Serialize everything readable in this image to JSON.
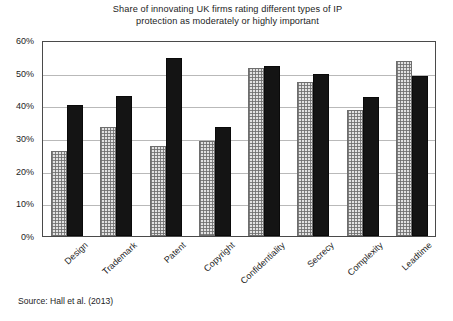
{
  "chart_data": {
    "type": "bar",
    "title": "Share of innovating UK firms rating different types of IP protection as moderately or highly important",
    "title_lines": [
      "Share of innovating UK firms rating different types of IP",
      "protection as moderately or highly important"
    ],
    "xlabel": "",
    "ylabel": "",
    "ylim": [
      0,
      60
    ],
    "ytick_labels": [
      "0%",
      "10%",
      "20%",
      "30%",
      "40%",
      "50%",
      "60%"
    ],
    "ytick_values": [
      0,
      10,
      20,
      30,
      40,
      50,
      60
    ],
    "grid": true,
    "legend": null,
    "legend_position": "none",
    "categories": [
      "Design",
      "Trademark",
      "Patent",
      "Copyright",
      "Confidentiality",
      "Secrecy",
      "Complexity",
      "Leadtime"
    ],
    "series": [
      {
        "name": "series-light",
        "style": "light-hatched",
        "color": "#e2e2e2",
        "values": [
          26,
          33.5,
          27.5,
          29,
          51.5,
          47,
          38.5,
          53.5
        ]
      },
      {
        "name": "series-dark",
        "style": "solid-black",
        "color": "#141414",
        "values": [
          40,
          43,
          54.5,
          33.5,
          52,
          49.5,
          42.5,
          49
        ]
      }
    ],
    "annotations": []
  },
  "source": {
    "text": "Source: Hall et al. (2013)"
  }
}
